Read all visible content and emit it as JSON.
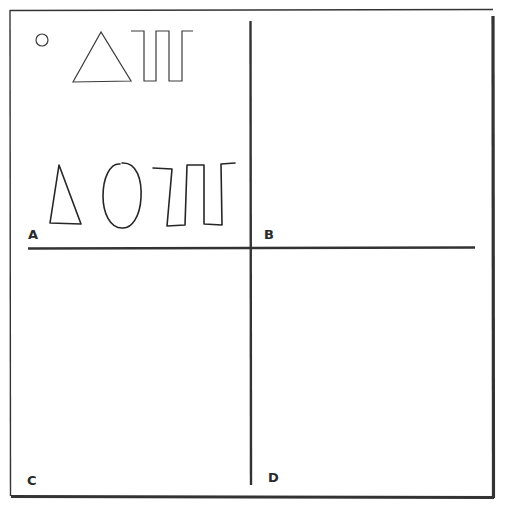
{
  "figure": {
    "colors": {
      "ink": "#2e2e2e",
      "paper": "#ffffff"
    },
    "panels": [
      {
        "id": "A",
        "label": "A",
        "models": [
          "small-circle",
          "triangle",
          "meander-pattern"
        ],
        "copies": [
          "triangle",
          "oval",
          "meander-pattern"
        ]
      },
      {
        "id": "B",
        "label": "B",
        "models": [
          "small-square",
          "circle",
          "triangle"
        ],
        "copies": [
          "quadrilateral",
          "oval",
          "triangle"
        ]
      },
      {
        "id": "C",
        "label": "C",
        "models": [
          "circle-with-vertical-line",
          "inverted-triangle",
          "small-square"
        ],
        "copies": [
          "circle-with-vertical-line",
          "small-triangle",
          "small-quadrilateral"
        ]
      },
      {
        "id": "D",
        "label": "D",
        "models": [
          "square-with-arc",
          "square-with-diagonal",
          "small-square"
        ],
        "copies": [
          "square-with-arc",
          "square-with-diagonal",
          "small-rectangle"
        ]
      }
    ]
  }
}
